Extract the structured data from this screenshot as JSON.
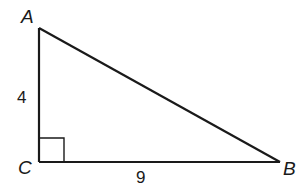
{
  "diagram": {
    "type": "right-triangle",
    "vertices": {
      "A": {
        "label": "A",
        "x": 39,
        "y": 28
      },
      "B": {
        "label": "B",
        "x": 280,
        "y": 162
      },
      "C": {
        "label": "C",
        "x": 39,
        "y": 162
      }
    },
    "sides": {
      "AC": {
        "label": "4"
      },
      "CB": {
        "label": "9"
      }
    },
    "right_angle_at": "C",
    "stroke_color": "#1a1a1a"
  }
}
